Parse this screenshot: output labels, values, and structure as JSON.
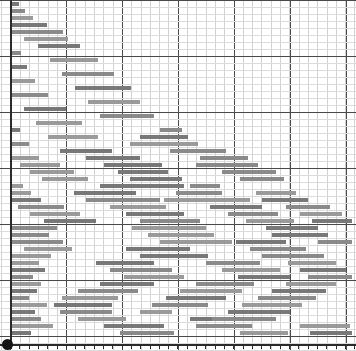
{
  "chart_data": {
    "type": "bar",
    "subtype": "gantt",
    "title": "",
    "xlabel": "",
    "ylabel": "",
    "grid": true,
    "legend": "none",
    "xlim": [
      0,
      356
    ],
    "ylim": [
      0,
      48
    ],
    "axis": {
      "y_axis_x": 10,
      "x_axis_y": 345,
      "tick_count": 38,
      "tick_spacing": 9.3
    },
    "grid_spec": {
      "minor_v_spacing": 9.3,
      "major_v_spacing": 56,
      "minor_h_spacing": 7,
      "major_h_spacing": 56,
      "minor_color": "#d2d2d2",
      "major_color": "#4a4a4a"
    },
    "bar_color": "#8a8a8a",
    "row_height": 7,
    "bar_height": 4,
    "categories": [
      "Task 01",
      "Task 02",
      "Task 03",
      "Task 04",
      "Task 05",
      "Task 06",
      "Task 07",
      "Task 08",
      "Task 09",
      "Task 10",
      "Task 11",
      "Task 12",
      "Task 13",
      "Task 14",
      "Task 15",
      "Task 16",
      "Task 17",
      "Task 18",
      "Task 19",
      "Task 20",
      "Task 21",
      "Task 22",
      "Task 23",
      "Task 24",
      "Task 25",
      "Task 26",
      "Task 27",
      "Task 28",
      "Task 29",
      "Task 30",
      "Task 31",
      "Task 32",
      "Task 33",
      "Task 34",
      "Task 35",
      "Task 36",
      "Task 37",
      "Task 38",
      "Task 39",
      "Task 40",
      "Task 41",
      "Task 42",
      "Task 43",
      "Task 44",
      "Task 45",
      "Task 46",
      "Task 47",
      "Task 48"
    ],
    "bars": [
      {
        "row": 0,
        "x": 11,
        "w": 8,
        "label": ""
      },
      {
        "row": 1,
        "x": 11,
        "w": 14,
        "label": ""
      },
      {
        "row": 2,
        "x": 11,
        "w": 22,
        "label": ""
      },
      {
        "row": 3,
        "x": 12,
        "w": 35,
        "label": ""
      },
      {
        "row": 4,
        "x": 11,
        "w": 52,
        "label": ""
      },
      {
        "row": 5,
        "x": 24,
        "w": 44,
        "label": ""
      },
      {
        "row": 6,
        "x": 38,
        "w": 42,
        "label": ""
      },
      {
        "row": 7,
        "x": 11,
        "w": 10,
        "label": ""
      },
      {
        "row": 8,
        "x": 50,
        "w": 48,
        "label": ""
      },
      {
        "row": 9,
        "x": 11,
        "w": 16,
        "label": ""
      },
      {
        "row": 10,
        "x": 62,
        "w": 52,
        "label": ""
      },
      {
        "row": 11,
        "x": 11,
        "w": 24,
        "label": ""
      },
      {
        "row": 12,
        "x": 75,
        "w": 56,
        "label": ""
      },
      {
        "row": 13,
        "x": 12,
        "w": 36,
        "label": ""
      },
      {
        "row": 14,
        "x": 88,
        "w": 52,
        "label": ""
      },
      {
        "row": 15,
        "x": 24,
        "w": 42,
        "label": ""
      },
      {
        "row": 16,
        "x": 100,
        "w": 54,
        "label": ""
      },
      {
        "row": 17,
        "x": 36,
        "w": 46,
        "label": ""
      },
      {
        "row": 18,
        "x": 11,
        "w": 9,
        "label": ""
      },
      {
        "row": 18,
        "x": 160,
        "w": 22,
        "label": ""
      },
      {
        "row": 19,
        "x": 48,
        "w": 50,
        "label": ""
      },
      {
        "row": 19,
        "x": 140,
        "w": 48,
        "label": ""
      },
      {
        "row": 20,
        "x": 11,
        "w": 18,
        "label": ""
      },
      {
        "row": 20,
        "x": 130,
        "w": 68,
        "label": ""
      },
      {
        "row": 21,
        "x": 60,
        "w": 52,
        "label": ""
      },
      {
        "row": 21,
        "x": 170,
        "w": 56,
        "label": ""
      },
      {
        "row": 22,
        "x": 11,
        "w": 28,
        "label": ""
      },
      {
        "row": 22,
        "x": 86,
        "w": 54,
        "label": ""
      },
      {
        "row": 22,
        "x": 200,
        "w": 48,
        "label": ""
      },
      {
        "row": 23,
        "x": 20,
        "w": 40,
        "label": ""
      },
      {
        "row": 23,
        "x": 104,
        "w": 58,
        "label": ""
      },
      {
        "row": 23,
        "x": 196,
        "w": 62,
        "label": ""
      },
      {
        "row": 24,
        "x": 30,
        "w": 44,
        "label": ""
      },
      {
        "row": 24,
        "x": 118,
        "w": 50,
        "label": ""
      },
      {
        "row": 24,
        "x": 222,
        "w": 54,
        "label": ""
      },
      {
        "row": 25,
        "x": 42,
        "w": 46,
        "label": ""
      },
      {
        "row": 25,
        "x": 130,
        "w": 52,
        "label": ""
      },
      {
        "row": 25,
        "x": 240,
        "w": 44,
        "label": ""
      },
      {
        "row": 26,
        "x": 11,
        "w": 12,
        "label": ""
      },
      {
        "row": 26,
        "x": 100,
        "w": 84,
        "label": ""
      },
      {
        "row": 26,
        "x": 190,
        "w": 30,
        "label": ""
      },
      {
        "row": 27,
        "x": 11,
        "w": 20,
        "label": ""
      },
      {
        "row": 27,
        "x": 74,
        "w": 62,
        "label": ""
      },
      {
        "row": 27,
        "x": 176,
        "w": 46,
        "label": ""
      },
      {
        "row": 27,
        "x": 256,
        "w": 40,
        "label": ""
      },
      {
        "row": 28,
        "x": 11,
        "w": 30,
        "label": ""
      },
      {
        "row": 28,
        "x": 86,
        "w": 74,
        "label": ""
      },
      {
        "row": 28,
        "x": 164,
        "w": 86,
        "label": ""
      },
      {
        "row": 28,
        "x": 262,
        "w": 46,
        "label": ""
      },
      {
        "row": 29,
        "x": 18,
        "w": 46,
        "label": ""
      },
      {
        "row": 29,
        "x": 110,
        "w": 56,
        "label": ""
      },
      {
        "row": 29,
        "x": 210,
        "w": 52,
        "label": ""
      },
      {
        "row": 29,
        "x": 286,
        "w": 44,
        "label": ""
      },
      {
        "row": 30,
        "x": 30,
        "w": 50,
        "label": ""
      },
      {
        "row": 30,
        "x": 126,
        "w": 58,
        "label": ""
      },
      {
        "row": 30,
        "x": 228,
        "w": 50,
        "label": ""
      },
      {
        "row": 30,
        "x": 300,
        "w": 42,
        "label": ""
      },
      {
        "row": 31,
        "x": 44,
        "w": 52,
        "label": ""
      },
      {
        "row": 31,
        "x": 140,
        "w": 60,
        "label": ""
      },
      {
        "row": 31,
        "x": 246,
        "w": 48,
        "label": ""
      },
      {
        "row": 31,
        "x": 312,
        "w": 40,
        "label": ""
      },
      {
        "row": 32,
        "x": 11,
        "w": 46,
        "label": ""
      },
      {
        "row": 32,
        "x": 132,
        "w": 74,
        "label": ""
      },
      {
        "row": 32,
        "x": 266,
        "w": 52,
        "label": ""
      },
      {
        "row": 33,
        "x": 11,
        "w": 38,
        "label": ""
      },
      {
        "row": 33,
        "x": 148,
        "w": 66,
        "label": ""
      },
      {
        "row": 33,
        "x": 272,
        "w": 56,
        "label": ""
      },
      {
        "row": 34,
        "x": 11,
        "w": 52,
        "label": ""
      },
      {
        "row": 34,
        "x": 160,
        "w": 72,
        "label": ""
      },
      {
        "row": 34,
        "x": 236,
        "w": 50,
        "label": ""
      },
      {
        "row": 34,
        "x": 318,
        "w": 34,
        "label": ""
      },
      {
        "row": 35,
        "x": 24,
        "w": 48,
        "label": ""
      },
      {
        "row": 35,
        "x": 126,
        "w": 64,
        "label": ""
      },
      {
        "row": 35,
        "x": 250,
        "w": 56,
        "label": ""
      },
      {
        "row": 36,
        "x": 11,
        "w": 40,
        "label": ""
      },
      {
        "row": 36,
        "x": 140,
        "w": 68,
        "label": ""
      },
      {
        "row": 36,
        "x": 262,
        "w": 62,
        "label": ""
      },
      {
        "row": 37,
        "x": 11,
        "w": 28,
        "label": ""
      },
      {
        "row": 37,
        "x": 96,
        "w": 58,
        "label": ""
      },
      {
        "row": 37,
        "x": 206,
        "w": 54,
        "label": ""
      },
      {
        "row": 37,
        "x": 288,
        "w": 48,
        "label": ""
      },
      {
        "row": 38,
        "x": 11,
        "w": 34,
        "label": ""
      },
      {
        "row": 38,
        "x": 110,
        "w": 62,
        "label": ""
      },
      {
        "row": 38,
        "x": 222,
        "w": 58,
        "label": ""
      },
      {
        "row": 38,
        "x": 300,
        "w": 46,
        "label": ""
      },
      {
        "row": 39,
        "x": 11,
        "w": 22,
        "label": ""
      },
      {
        "row": 39,
        "x": 124,
        "w": 60,
        "label": ""
      },
      {
        "row": 39,
        "x": 238,
        "w": 52,
        "label": ""
      },
      {
        "row": 39,
        "x": 308,
        "w": 44,
        "label": ""
      },
      {
        "row": 40,
        "x": 11,
        "w": 30,
        "label": ""
      },
      {
        "row": 40,
        "x": 100,
        "w": 54,
        "label": ""
      },
      {
        "row": 40,
        "x": 196,
        "w": 58,
        "label": ""
      },
      {
        "row": 40,
        "x": 286,
        "w": 50,
        "label": ""
      },
      {
        "row": 41,
        "x": 11,
        "w": 26,
        "label": ""
      },
      {
        "row": 41,
        "x": 78,
        "w": 60,
        "label": ""
      },
      {
        "row": 41,
        "x": 180,
        "w": 62,
        "label": ""
      },
      {
        "row": 41,
        "x": 272,
        "w": 54,
        "label": ""
      },
      {
        "row": 42,
        "x": 11,
        "w": 18,
        "label": ""
      },
      {
        "row": 42,
        "x": 62,
        "w": 56,
        "label": ""
      },
      {
        "row": 42,
        "x": 166,
        "w": 60,
        "label": ""
      },
      {
        "row": 42,
        "x": 258,
        "w": 58,
        "label": ""
      },
      {
        "row": 43,
        "x": 11,
        "w": 36,
        "label": ""
      },
      {
        "row": 43,
        "x": 54,
        "w": 58,
        "label": ""
      },
      {
        "row": 43,
        "x": 152,
        "w": 56,
        "label": ""
      },
      {
        "row": 43,
        "x": 242,
        "w": 60,
        "label": ""
      },
      {
        "row": 44,
        "x": 11,
        "w": 24,
        "label": ""
      },
      {
        "row": 44,
        "x": 60,
        "w": 52,
        "label": ""
      },
      {
        "row": 44,
        "x": 140,
        "w": 32,
        "label": ""
      },
      {
        "row": 44,
        "x": 228,
        "w": 62,
        "label": ""
      },
      {
        "row": 45,
        "x": 11,
        "w": 30,
        "label": ""
      },
      {
        "row": 45,
        "x": 78,
        "w": 48,
        "label": ""
      },
      {
        "row": 45,
        "x": 190,
        "w": 50,
        "label": ""
      },
      {
        "row": 45,
        "x": 212,
        "w": 64,
        "label": ""
      },
      {
        "row": 46,
        "x": 11,
        "w": 42,
        "label": ""
      },
      {
        "row": 46,
        "x": 104,
        "w": 60,
        "label": ""
      },
      {
        "row": 46,
        "x": 196,
        "w": 56,
        "label": ""
      },
      {
        "row": 46,
        "x": 300,
        "w": 50,
        "label": ""
      },
      {
        "row": 47,
        "x": 11,
        "w": 20,
        "label": ""
      },
      {
        "row": 47,
        "x": 120,
        "w": 54,
        "label": ""
      },
      {
        "row": 47,
        "x": 240,
        "w": 48,
        "label": ""
      },
      {
        "row": 47,
        "x": 310,
        "w": 42,
        "label": ""
      }
    ]
  }
}
